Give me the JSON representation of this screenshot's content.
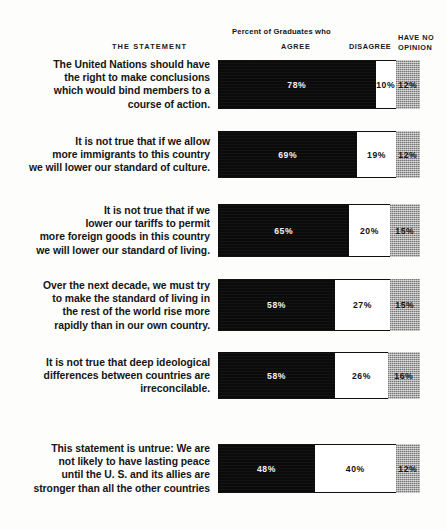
{
  "header": {
    "percent_title": "Percent of Graduates who",
    "statement_col": "THE  STATEMENT",
    "agree_col": "AGREE",
    "disagree_col": "DISAGREE",
    "no_opinion_col_line1": "HAVE NO",
    "no_opinion_col_line2": "OPINION"
  },
  "colors": {
    "agree": "#0b0b0b",
    "disagree": "#ffffff",
    "no_opinion": "#a9a9a9",
    "background": "#fdfdfc",
    "text": "#151515"
  },
  "chart_data": {
    "type": "bar",
    "title": "Percent of Graduates who",
    "xlabel": "",
    "ylabel": "",
    "xlim": [
      0,
      100
    ],
    "grid": false,
    "stacked": true,
    "orientation": "horizontal",
    "legend_position": "top",
    "legend": [
      "AGREE",
      "DISAGREE",
      "HAVE NO OPINION"
    ],
    "categories": [
      "The United Nations should have the right to make conclusions which would bind members to a course of action.",
      "It is not true that if we allow more immigrants to this country we will lower our standard of culture.",
      "It is not true that if we lower our tariffs to permit more foreign goods in this country we will lower our standard of living.",
      "Over the next decade, we must try to make the standard of living in the rest of the world rise more rapidly than in our own country.",
      "It is not true that deep ideological differences between countries are irreconcilable.",
      "This statement is untrue: We are not likely to have lasting peace until the U. S. and its allies are stronger than all the other countries"
    ],
    "series": [
      {
        "name": "AGREE",
        "values": [
          78,
          69,
          65,
          58,
          58,
          48
        ]
      },
      {
        "name": "DISAGREE",
        "values": [
          10,
          19,
          20,
          27,
          26,
          40
        ]
      },
      {
        "name": "HAVE NO OPINION",
        "values": [
          12,
          12,
          15,
          15,
          16,
          12
        ]
      }
    ]
  },
  "rows": [
    {
      "statement_lines": [
        "The United Nations should have",
        "the right to make conclusions",
        "which would bind members to a",
        "course of action."
      ],
      "agree": 78,
      "disagree": 10,
      "no_opinion": 12,
      "agree_label": "78%",
      "disagree_label": "10%",
      "no_opinion_label": "12%"
    },
    {
      "statement_lines": [
        "It is not true that if we allow",
        "more immigrants to this country",
        "we will lower our standard of culture."
      ],
      "agree": 69,
      "disagree": 19,
      "no_opinion": 12,
      "agree_label": "69%",
      "disagree_label": "19%",
      "no_opinion_label": "12%"
    },
    {
      "statement_lines": [
        "It is not true that if we",
        "lower our tariffs to permit",
        "more foreign goods in this country",
        "we will lower our standard of living."
      ],
      "agree": 65,
      "disagree": 20,
      "no_opinion": 15,
      "agree_label": "65%",
      "disagree_label": "20%",
      "no_opinion_label": "15%"
    },
    {
      "statement_lines": [
        "Over the next decade, we must try",
        "to make the standard of living in",
        "the rest of the world rise more",
        "rapidly than in our own country."
      ],
      "agree": 58,
      "disagree": 27,
      "no_opinion": 15,
      "agree_label": "58%",
      "disagree_label": "27%",
      "no_opinion_label": "15%"
    },
    {
      "statement_lines": [
        "It is not true that deep ideological",
        "differences between countries are",
        "irreconcilable."
      ],
      "agree": 58,
      "disagree": 26,
      "no_opinion": 16,
      "agree_label": "58%",
      "disagree_label": "26%",
      "no_opinion_label": "16%"
    },
    {
      "statement_lines": [
        "This statement is untrue: We are",
        "not likely to have lasting peace",
        "until the U. S. and its allies are",
        "stronger than all the other countries"
      ],
      "agree": 48,
      "disagree": 40,
      "no_opinion": 12,
      "agree_label": "48%",
      "disagree_label": "40%",
      "no_opinion_label": "12%"
    }
  ]
}
